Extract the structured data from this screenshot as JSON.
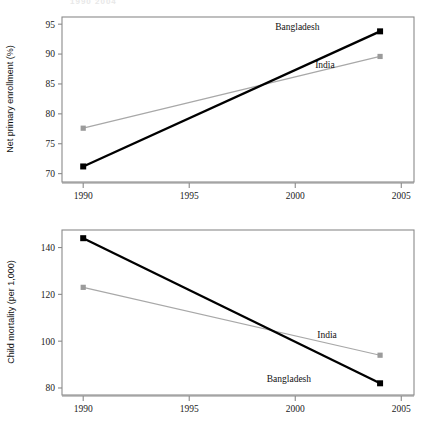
{
  "page": {
    "clipped_header_text": "1990   2004"
  },
  "chart_data": [
    {
      "id": "net-primary-enrollment",
      "type": "line",
      "title": "",
      "xlabel": "",
      "ylabel": "Net primary enrollment (%)",
      "xlim": [
        1989.0,
        2005.6
      ],
      "ylim": [
        68.6,
        96.2
      ],
      "xticks": [
        1990,
        1995,
        2000,
        2005
      ],
      "yticks": [
        70,
        75,
        80,
        85,
        90,
        95
      ],
      "xtick_labels": [
        "1990",
        "1995",
        "2000",
        "2005"
      ],
      "ytick_labels": [
        "70",
        "75",
        "80",
        "85",
        "90",
        "95"
      ],
      "grid": false,
      "legend_position": "inline-annotations",
      "x": [
        1990,
        2004
      ],
      "series": [
        {
          "name": "Bangladesh",
          "values": [
            71.2,
            93.8
          ],
          "color": "#000000",
          "marker": "square",
          "label_x": 2000.1,
          "label_y": 94.1
        },
        {
          "name": "India",
          "values": [
            77.6,
            89.6
          ],
          "color": "#9b9b9b",
          "marker": "square",
          "label_x": 2001.4,
          "label_y": 87.6
        }
      ]
    },
    {
      "id": "child-mortality",
      "type": "line",
      "title": "",
      "xlabel": "",
      "ylabel": "Child mortality (per 1,000)",
      "xlim": [
        1989.0,
        2005.6
      ],
      "ylim": [
        77.0,
        147.5
      ],
      "xticks": [
        1990,
        1995,
        2000,
        2005
      ],
      "yticks": [
        80,
        100,
        120,
        140
      ],
      "xtick_labels": [
        "1990",
        "1995",
        "2000",
        "2005"
      ],
      "ytick_labels": [
        "80",
        "100",
        "120",
        "140"
      ],
      "grid": false,
      "legend_position": "inline-annotations",
      "x": [
        1990,
        2004
      ],
      "series": [
        {
          "name": "Bangladesh",
          "values": [
            144.0,
            82.0
          ],
          "color": "#000000",
          "marker": "square",
          "label_x": 1999.7,
          "label_y": 82.6
        },
        {
          "name": "India",
          "values": [
            123.0,
            94.0
          ],
          "color": "#9b9b9b",
          "marker": "square",
          "label_x": 2001.5,
          "label_y": 101.5
        }
      ]
    }
  ]
}
